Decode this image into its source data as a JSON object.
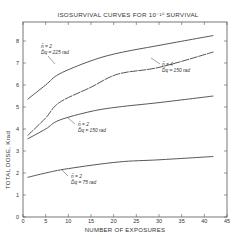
{
  "chart_data": {
    "type": "line",
    "title": "ISOSURVIVAL CURVES FOR 10⁻¹⁰ SURVIVAL",
    "xlabel": "NUMBER OF EXPOSURES",
    "ylabel": "TOTAL DOSE, Krad",
    "xlim": [
      0,
      45
    ],
    "ylim": [
      0,
      8.5
    ],
    "xticks": [
      0,
      5,
      10,
      15,
      20,
      25,
      30,
      35,
      40,
      45
    ],
    "yticks": [
      0,
      1,
      2,
      3,
      4,
      5,
      6,
      7,
      8
    ],
    "grid": false,
    "series": [
      {
        "name": "n = 2, Dq = 225 rad",
        "label_line1": "n̄ = 2",
        "label_line2": "D̄q = 225 rad",
        "x": [
          1,
          5,
          8,
          15,
          21,
          30,
          42
        ],
        "y": [
          5.35,
          6.0,
          6.5,
          7.1,
          7.45,
          7.8,
          8.25
        ]
      },
      {
        "name": "n = 4, Dq = 150 rad",
        "label_line1": "n̄ = 4",
        "label_line2": "D̄q = 150 rad",
        "x": [
          1,
          5,
          8,
          15,
          21,
          30,
          42
        ],
        "y": [
          3.7,
          4.5,
          5.2,
          5.9,
          6.5,
          6.8,
          7.5
        ]
      },
      {
        "name": "n = 2, Dq = 150 rad",
        "label_line1": "n̄ = 2",
        "label_line2": "D̄q = 150 rad",
        "x": [
          1,
          5,
          8,
          15,
          21,
          30,
          42
        ],
        "y": [
          3.55,
          4.0,
          4.4,
          4.8,
          5.0,
          5.2,
          5.5
        ]
      },
      {
        "name": "n = 2, Dq = 75 rad",
        "label_line1": "n̄ = 2",
        "label_line2": "D̄q = 75 rad",
        "x": [
          1,
          5,
          10,
          21,
          30,
          42
        ],
        "y": [
          1.8,
          2.0,
          2.2,
          2.5,
          2.6,
          2.75
        ]
      }
    ]
  }
}
